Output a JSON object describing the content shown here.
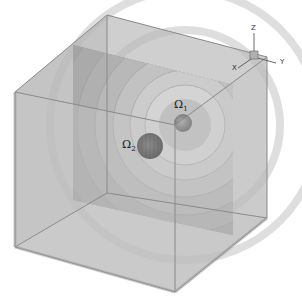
{
  "figure": {
    "type": "3d-domain-diagram"
  },
  "labels": {
    "omega1": "Ω",
    "omega1_sub": "1",
    "omega2": "Ω",
    "omega2_sub": "2"
  },
  "axes": {
    "x": "X",
    "y": "Y",
    "z": "Z"
  },
  "colors": {
    "background": "#ffffff",
    "cube_face": "#c8c8c8",
    "cube_edge": "#8a8a8a",
    "contour_light": "#d4d4d4",
    "contour_mid": "#b4b4b4",
    "contour_dark": "#9a9a9a",
    "sphere1": "#7a7a7a",
    "sphere2": "#4a4a4a"
  }
}
